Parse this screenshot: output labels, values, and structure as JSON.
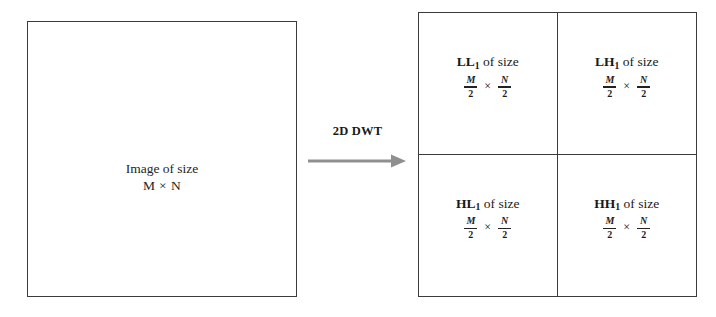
{
  "diagram": {
    "source": {
      "label_line1": "Image of size",
      "label_line2": "M × N"
    },
    "transform": {
      "label": "2D DWT",
      "arrow_icon": "right-arrow-icon",
      "arrow_color": "#8f8f8f"
    },
    "subbands": [
      {
        "band": "LL",
        "subscript": "1",
        "of_size": " of size",
        "numerator_1": "M",
        "denominator_1": "2",
        "times": "×",
        "numerator_2": "N",
        "denominator_2": "2"
      },
      {
        "band": "LH",
        "subscript": "1",
        "of_size": " of size",
        "numerator_1": "M",
        "denominator_1": "2",
        "times": "×",
        "numerator_2": "N",
        "denominator_2": "2"
      },
      {
        "band": "HL",
        "subscript": "1",
        "of_size": " of size",
        "numerator_1": "M",
        "denominator_1": "2",
        "times": "×",
        "numerator_2": "N",
        "denominator_2": "2"
      },
      {
        "band": "HH",
        "subscript": "1",
        "of_size": " of size",
        "numerator_1": "M",
        "denominator_1": "2",
        "times": "×",
        "numerator_2": "N",
        "denominator_2": "2"
      }
    ],
    "colors": {
      "border": "#3b3b3b",
      "text": "#1c1c1c",
      "background": "#ffffff"
    }
  }
}
